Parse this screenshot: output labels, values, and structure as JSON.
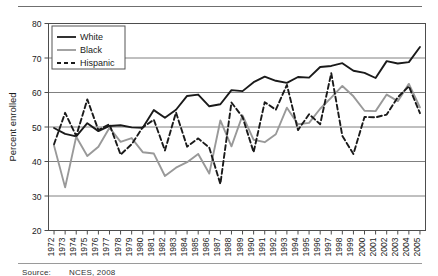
{
  "figure": {
    "source_prefix": "Source:",
    "source_text": "NCES, 2008"
  },
  "chart_data": {
    "type": "line",
    "title": "",
    "xlabel": "",
    "ylabel": "Percent enrolled",
    "ylim": [
      20,
      80
    ],
    "ytick_step": 10,
    "yticks": [
      "20",
      "30",
      "40",
      "50",
      "60",
      "70",
      "80"
    ],
    "grid": true,
    "grid_axis": "y",
    "legend_position": "top-left",
    "legend": [
      "White",
      "Black",
      "Hispanic"
    ],
    "colors": {
      "White": "#1a1a1a",
      "Black": "#999999",
      "Hispanic": "#1a1a1a",
      "gridline": "#808080",
      "axis": "#4d4d4d"
    },
    "line_styles": {
      "White": "solid",
      "Black": "solid",
      "Hispanic": "dashed"
    },
    "categories": [
      "1972",
      "1973",
      "1974",
      "1975",
      "1976",
      "1977",
      "1978",
      "1979",
      "1980",
      "1981",
      "1982",
      "1983",
      "1984",
      "1985",
      "1986",
      "1987",
      "1988",
      "1989",
      "1990",
      "1991",
      "1992",
      "1993",
      "1994",
      "1995",
      "1996",
      "1997",
      "1998",
      "1999",
      "2000",
      "2001",
      "2002",
      "2003",
      "2004",
      "2005"
    ],
    "x": [
      1972,
      1973,
      1974,
      1975,
      1976,
      1977,
      1978,
      1979,
      1980,
      1981,
      1982,
      1983,
      1984,
      1985,
      1986,
      1987,
      1988,
      1989,
      1990,
      1991,
      1992,
      1993,
      1994,
      1995,
      1996,
      1997,
      1998,
      1999,
      2000,
      2001,
      2002,
      2003,
      2004,
      2005
    ],
    "series": [
      {
        "name": "White",
        "values": [
          49.7,
          48.0,
          47.3,
          51.1,
          48.8,
          50.3,
          50.5,
          49.9,
          49.8,
          54.9,
          52.7,
          55.0,
          59.0,
          59.4,
          56.0,
          56.6,
          60.7,
          60.4,
          63.0,
          64.6,
          63.4,
          62.8,
          64.5,
          64.3,
          67.4,
          67.7,
          68.5,
          66.3,
          65.7,
          64.2,
          69.1,
          68.4,
          68.8,
          73.2
        ]
      },
      {
        "name": "Black",
        "values": [
          44.6,
          32.5,
          47.2,
          41.6,
          44.3,
          49.8,
          45.7,
          46.8,
          42.7,
          42.3,
          35.8,
          38.2,
          39.8,
          42.2,
          36.5,
          51.9,
          44.4,
          53.4,
          46.3,
          45.6,
          47.9,
          55.6,
          50.8,
          51.2,
          55.3,
          58.5,
          61.9,
          58.9,
          54.7,
          54.6,
          59.4,
          57.5,
          62.5,
          55.7
        ]
      },
      {
        "name": "Hispanic",
        "values": [
          45.0,
          54.1,
          47.4,
          58.0,
          49.1,
          50.8,
          42.0,
          45.0,
          49.9,
          52.1,
          43.2,
          54.2,
          44.3,
          46.7,
          44.0,
          33.5,
          57.1,
          52.9,
          42.7,
          57.2,
          55.0,
          62.2,
          49.1,
          53.7,
          50.8,
          65.6,
          47.4,
          42.2,
          52.9,
          52.8,
          53.6,
          58.6,
          61.8,
          54.0
        ]
      }
    ]
  }
}
